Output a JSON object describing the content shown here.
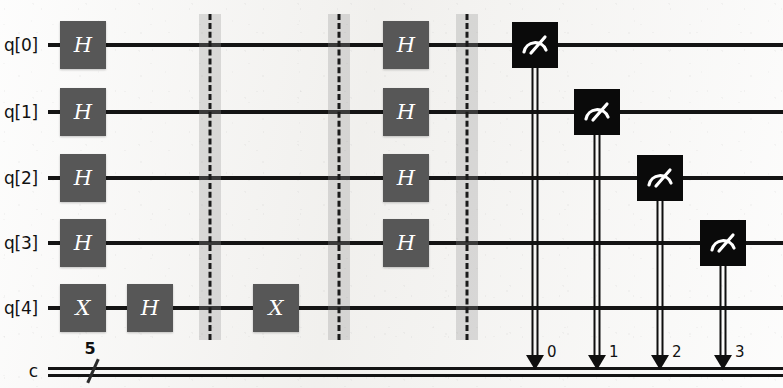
{
  "figure": {
    "kind": "quantum-circuit-diagram",
    "width": 783,
    "height": 388,
    "background_color": "#f2f1ef",
    "wire_color": "#141414",
    "gate_fill": "#575757",
    "gate_text_color": "#ffffff",
    "measure_fill": "#0a0a0a",
    "measure_glyph_color": "#ffffff",
    "barrier_band_color": "#969696",
    "barrier_dash_color": "#1a1a1a"
  },
  "quantum_registers": [
    {
      "label": "q[0]",
      "y": 45
    },
    {
      "label": "q[1]",
      "y": 112
    },
    {
      "label": "q[2]",
      "y": 178
    },
    {
      "label": "q[3]",
      "y": 243
    },
    {
      "label": "q[4]",
      "y": 308
    }
  ],
  "classical_register": {
    "label": "c",
    "size_label": "5",
    "y": 371,
    "slash_x": 93,
    "count_x": 90,
    "count_y": 358,
    "start_x": 48,
    "end_x": 783
  },
  "wires": {
    "start_x": 48,
    "end_x": 783
  },
  "gates": [
    {
      "name": "H",
      "qubit": 0,
      "x": 83,
      "y": 45,
      "w": 46,
      "h": 48
    },
    {
      "name": "H",
      "qubit": 1,
      "x": 83,
      "y": 112,
      "w": 46,
      "h": 48
    },
    {
      "name": "H",
      "qubit": 2,
      "x": 83,
      "y": 178,
      "w": 46,
      "h": 48
    },
    {
      "name": "H",
      "qubit": 3,
      "x": 83,
      "y": 243,
      "w": 46,
      "h": 48
    },
    {
      "name": "X",
      "qubit": 4,
      "x": 83,
      "y": 308,
      "w": 46,
      "h": 48
    },
    {
      "name": "H",
      "qubit": 4,
      "x": 150,
      "y": 308,
      "w": 46,
      "h": 48
    },
    {
      "name": "X",
      "qubit": 4,
      "x": 276,
      "y": 308,
      "w": 46,
      "h": 48
    },
    {
      "name": "H",
      "qubit": 0,
      "x": 406,
      "y": 45,
      "w": 46,
      "h": 48
    },
    {
      "name": "H",
      "qubit": 1,
      "x": 406,
      "y": 112,
      "w": 46,
      "h": 48
    },
    {
      "name": "H",
      "qubit": 2,
      "x": 406,
      "y": 178,
      "w": 46,
      "h": 48
    },
    {
      "name": "H",
      "qubit": 3,
      "x": 406,
      "y": 243,
      "w": 46,
      "h": 48
    }
  ],
  "barriers": [
    {
      "x": 210,
      "top": 14,
      "bottom": 340
    },
    {
      "x": 339,
      "top": 14,
      "bottom": 340
    },
    {
      "x": 467,
      "top": 14,
      "bottom": 340
    }
  ],
  "measurements": [
    {
      "qubit": 0,
      "x": 535,
      "y": 45,
      "size": 46,
      "clbit_index": "0",
      "index_x": 547,
      "index_y": 352
    },
    {
      "qubit": 1,
      "x": 597,
      "y": 112,
      "size": 46,
      "clbit_index": "1",
      "index_x": 609,
      "index_y": 352
    },
    {
      "qubit": 2,
      "x": 660,
      "y": 178,
      "size": 46,
      "clbit_index": "2",
      "index_x": 672,
      "index_y": 352
    },
    {
      "qubit": 3,
      "x": 723,
      "y": 243,
      "size": 46,
      "clbit_index": "3",
      "index_x": 735,
      "index_y": 352
    }
  ]
}
